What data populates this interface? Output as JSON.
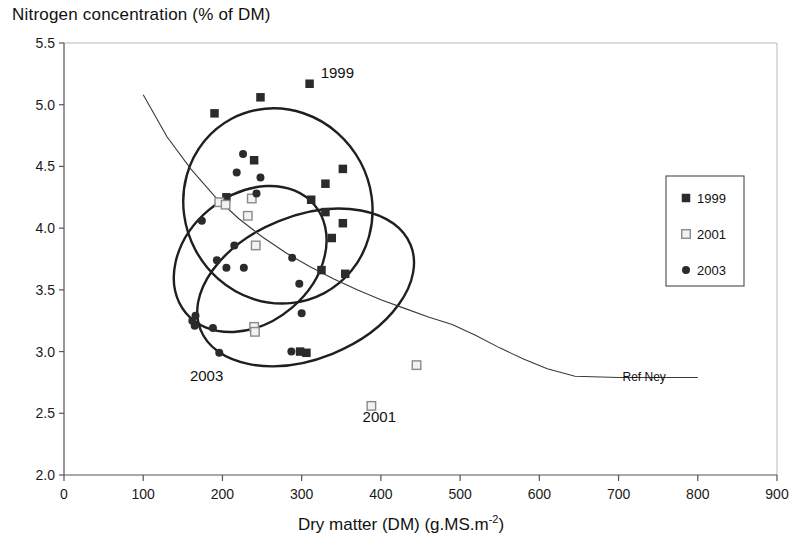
{
  "chart_data": {
    "type": "scatter",
    "title": "",
    "ylabel": "Nitrogen concentration (% of DM)",
    "xlabel": "Dry matter (DM) (g.MS.m",
    "xlabel_sup": "-2",
    "xlabel_tail": ")",
    "xlim": [
      0,
      900
    ],
    "ylim": [
      2.0,
      5.5
    ],
    "xticks": [
      "0",
      "100",
      "200",
      "300",
      "400",
      "500",
      "600",
      "700",
      "800",
      "900"
    ],
    "xtick_values": [
      0,
      100,
      200,
      300,
      400,
      500,
      600,
      700,
      800,
      900
    ],
    "yticks": [
      "2.0",
      "2.5",
      "3.0",
      "3.5",
      "4.0",
      "4.5",
      "5.0",
      "5.5"
    ],
    "ytick_values": [
      2.0,
      2.5,
      3.0,
      3.5,
      4.0,
      4.5,
      5.0,
      5.5
    ],
    "grid": false,
    "legend_position": "right",
    "legend": [
      {
        "label": "1999",
        "marker": "filled-square",
        "color": "#2b2b2b"
      },
      {
        "label": "2001",
        "marker": "open-square",
        "color": "#8a8a8a"
      },
      {
        "label": "2003",
        "marker": "filled-circle",
        "color": "#2b2b2b"
      }
    ],
    "series": [
      {
        "name": "1999",
        "marker": "filled-square",
        "color": "#2b2b2b",
        "points": [
          [
            190,
            4.93
          ],
          [
            248,
            5.06
          ],
          [
            310,
            5.17
          ],
          [
            240,
            4.55
          ],
          [
            330,
            4.36
          ],
          [
            352,
            4.48
          ],
          [
            312,
            4.23
          ],
          [
            330,
            4.13
          ],
          [
            352,
            4.04
          ],
          [
            338,
            3.92
          ],
          [
            325,
            3.66
          ],
          [
            355,
            3.63
          ],
          [
            205,
            4.25
          ],
          [
            298,
            3.0
          ],
          [
            306,
            2.99
          ]
        ]
      },
      {
        "name": "2001",
        "marker": "open-square",
        "color": "#8a8a8a",
        "points": [
          [
            196,
            4.21
          ],
          [
            204,
            4.19
          ],
          [
            237,
            4.24
          ],
          [
            232,
            4.1
          ],
          [
            242,
            3.86
          ],
          [
            240,
            3.2
          ],
          [
            241,
            3.16
          ],
          [
            445,
            2.89
          ],
          [
            388,
            2.56
          ]
        ]
      },
      {
        "name": "2003",
        "marker": "filled-circle",
        "color": "#2b2b2b",
        "points": [
          [
            226,
            4.6
          ],
          [
            218,
            4.45
          ],
          [
            248,
            4.41
          ],
          [
            243,
            4.28
          ],
          [
            174,
            4.06
          ],
          [
            215,
            3.86
          ],
          [
            193,
            3.74
          ],
          [
            205,
            3.68
          ],
          [
            227,
            3.68
          ],
          [
            166,
            3.29
          ],
          [
            165,
            3.21
          ],
          [
            162,
            3.25
          ],
          [
            188,
            3.19
          ],
          [
            196,
            2.99
          ],
          [
            288,
            3.76
          ],
          [
            297,
            3.55
          ],
          [
            300,
            3.31
          ],
          [
            287,
            3.0
          ]
        ]
      }
    ],
    "ellipses": [
      {
        "label": "1999",
        "cx": 270,
        "cy": 4.18,
        "rx": 118,
        "ry": 0.8,
        "rotation_deg": -28,
        "label_x": 345,
        "label_y": 5.22
      },
      {
        "label": "2001",
        "cx": 305,
        "cy": 3.52,
        "rx": 143,
        "ry": 0.58,
        "rotation_deg": -22,
        "label_x": 398,
        "label_y": 2.43
      },
      {
        "label": "2003",
        "cx": 235,
        "cy": 3.75,
        "rx": 106,
        "ry": 0.52,
        "rotation_deg": -40,
        "label_x": 180,
        "label_y": 2.76
      }
    ],
    "reference_curve": {
      "name": "Ref Ney",
      "label": "Ref Ney",
      "label_x": 705,
      "label_y": 2.79,
      "points": [
        [
          100,
          5.08
        ],
        [
          130,
          4.74
        ],
        [
          160,
          4.48
        ],
        [
          190,
          4.26
        ],
        [
          220,
          4.08
        ],
        [
          250,
          3.93
        ],
        [
          280,
          3.8
        ],
        [
          310,
          3.69
        ],
        [
          340,
          3.59
        ],
        [
          370,
          3.5
        ],
        [
          400,
          3.42
        ],
        [
          430,
          3.35
        ],
        [
          460,
          3.28
        ],
        [
          490,
          3.22
        ],
        [
          520,
          3.13
        ],
        [
          550,
          3.03
        ],
        [
          580,
          2.94
        ],
        [
          610,
          2.86
        ],
        [
          645,
          2.8
        ],
        [
          700,
          2.79
        ],
        [
          760,
          2.79
        ],
        [
          800,
          2.79
        ]
      ]
    }
  }
}
